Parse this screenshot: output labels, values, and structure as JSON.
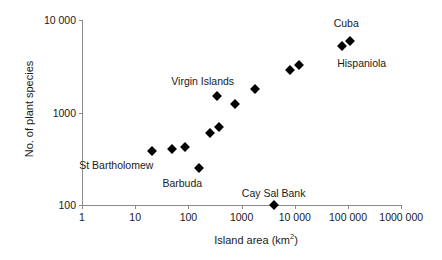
{
  "chart_data": {
    "type": "scatter",
    "title": "",
    "xlabel": "Island area (km2)",
    "xlabel_base": "Island area (km",
    "xlabel_sup": "2",
    "xlabel_tail": ")",
    "ylabel": "No. of plant species",
    "xscale": "log",
    "yscale": "log",
    "xlim": [
      1,
      1000000
    ],
    "ylim": [
      100,
      10000
    ],
    "grid": false,
    "legend": "none",
    "marker": "filled-diamond",
    "marker_color": "#000000",
    "xticks": [
      1,
      10,
      100,
      1000,
      10000,
      100000,
      1000000
    ],
    "xticklabels": [
      "1",
      "10",
      "100",
      "1000",
      "10 000",
      "100 000",
      "1000 000"
    ],
    "yticks": [
      100,
      1000,
      10000
    ],
    "yticklabels": [
      "100",
      "1000",
      "10 000"
    ],
    "points": [
      {
        "name": "St Bartholomew",
        "x": 21,
        "y": 380,
        "label": "St Bartholomew",
        "label_dx": -36,
        "label_dy": 14
      },
      {
        "name": "unlabelled-1",
        "x": 50,
        "y": 400,
        "label": "",
        "label_dx": 0,
        "label_dy": 0
      },
      {
        "name": "unlabelled-2",
        "x": 88,
        "y": 420,
        "label": "",
        "label_dx": 0,
        "label_dy": 0
      },
      {
        "name": "Barbuda",
        "x": 160,
        "y": 250,
        "label": "Barbuda",
        "label_dx": -17,
        "label_dy": 15
      },
      {
        "name": "unlabelled-3",
        "x": 255,
        "y": 600,
        "label": "",
        "label_dx": 0,
        "label_dy": 0
      },
      {
        "name": "unlabelled-4",
        "x": 380,
        "y": 700,
        "label": "",
        "label_dx": 0,
        "label_dy": 0
      },
      {
        "name": "Virgin Islands",
        "x": 340,
        "y": 1500,
        "label": "Virgin Islands",
        "label_dx": -14,
        "label_dy": -15
      },
      {
        "name": "unlabelled-5",
        "x": 740,
        "y": 1230,
        "label": "",
        "label_dx": 0,
        "label_dy": 0
      },
      {
        "name": "unlabelled-6",
        "x": 1800,
        "y": 1800,
        "label": "",
        "label_dx": 0,
        "label_dy": 0
      },
      {
        "name": "Cay Sal Bank",
        "x": 4000,
        "y": 100,
        "label": "Cay Sal Bank",
        "label_dx": 0,
        "label_dy": -12
      },
      {
        "name": "unlabelled-7",
        "x": 8000,
        "y": 2900,
        "label": "",
        "label_dx": 0,
        "label_dy": 0
      },
      {
        "name": "unlabelled-8",
        "x": 12000,
        "y": 3300,
        "label": "",
        "label_dx": 0,
        "label_dy": 0
      },
      {
        "name": "Hispaniola",
        "x": 76000,
        "y": 5200,
        "label": "Hispaniola",
        "label_dx": 20,
        "label_dy": 17
      },
      {
        "name": "Cuba",
        "x": 110000,
        "y": 5900,
        "label": "Cuba",
        "label_dx": -4,
        "label_dy": -18
      }
    ]
  }
}
